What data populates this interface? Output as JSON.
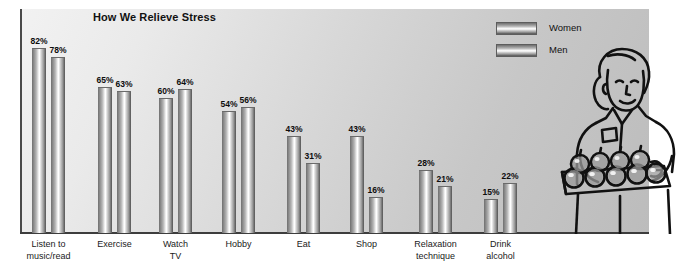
{
  "chart_data": {
    "type": "bar",
    "title": "How We Relieve Stress",
    "xlabel": "",
    "ylabel": "",
    "ylim": [
      0,
      100
    ],
    "grid": false,
    "legend_position": "top-right",
    "categories": [
      "Listen to\nmusic/read",
      "Exercise",
      "Watch\nTV",
      "Hobby",
      "Eat",
      "Shop",
      "Relaxation\ntechnique",
      "Drink\nalcohol"
    ],
    "series": [
      {
        "name": "Women",
        "values": [
          82,
          65,
          60,
          54,
          43,
          43,
          28,
          15
        ]
      },
      {
        "name": "Men",
        "values": [
          78,
          63,
          64,
          56,
          31,
          16,
          21,
          22
        ]
      }
    ],
    "value_suffix": "%"
  },
  "chart": {
    "title": "How We Relieve Stress",
    "categories": [
      {
        "line1": "Listen to",
        "line2": "music/read"
      },
      {
        "line1": "Exercise",
        "line2": ""
      },
      {
        "line1": "Watch",
        "line2": "TV"
      },
      {
        "line1": "Hobby",
        "line2": ""
      },
      {
        "line1": "Eat",
        "line2": ""
      },
      {
        "line1": "Shop",
        "line2": ""
      },
      {
        "line1": "Relaxation",
        "line2": "technique"
      },
      {
        "line1": "Drink",
        "line2": "alcohol"
      }
    ],
    "bar_labels": {
      "women": [
        "82%",
        "65%",
        "60%",
        "54%",
        "43%",
        "43%",
        "28%",
        "15%"
      ],
      "men": [
        "78%",
        "63%",
        "64%",
        "56%",
        "31%",
        "16%",
        "21%",
        "22%"
      ]
    },
    "legend": [
      {
        "label": "Women",
        "swatch": "gradient-bar-swatch"
      },
      {
        "label": "Men",
        "swatch": "gradient-bar-swatch"
      }
    ],
    "colors": {
      "bar_dark": "#555555",
      "bar_light": "#ffffff",
      "axis": "#3d3d3d",
      "text": "#111111",
      "panel_light": "#f2f2f2",
      "panel_dark": "#bcbcbc"
    },
    "illustration_alt": "woman-holding-tray-of-apples"
  }
}
